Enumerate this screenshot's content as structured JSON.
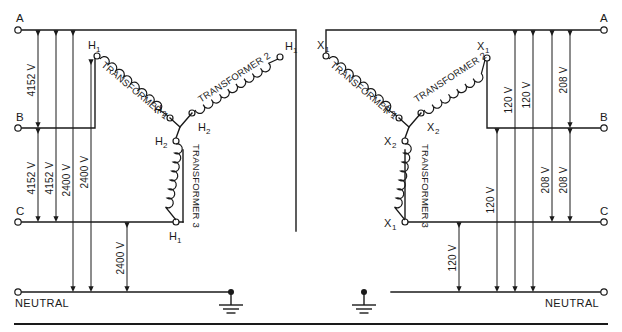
{
  "diagram": {
    "divider_label": "horizontal-rule",
    "ground_symbol": "earth-ground-icon"
  },
  "left": {
    "caption": "Primary wye (4152 V line-to-line, 2400 V line-to-neutral)",
    "neutral_label": "NEUTRAL",
    "bus_terminals": [
      {
        "name": "A",
        "label": "A"
      },
      {
        "name": "B",
        "label": "B"
      },
      {
        "name": "C",
        "label": "C"
      }
    ],
    "transformers": [
      {
        "id": "t1",
        "label": "TRANSFORMER 1",
        "term_start": "H",
        "term_start_sub": "1",
        "term_end": "H",
        "term_end_sub": "2"
      },
      {
        "id": "t2",
        "label": "TRANSFORMER 2",
        "term_start": "H",
        "term_start_sub": "1",
        "term_end": "H",
        "term_end_sub": "2"
      },
      {
        "id": "t3",
        "label": "TRANSFORMER 3",
        "term_start": "H",
        "term_start_sub": "2",
        "term_end": "H",
        "term_end_sub": "1"
      }
    ],
    "dimensions": [
      {
        "id": "l-ab",
        "value": "4152 V",
        "from": "A",
        "to": "B"
      },
      {
        "id": "l-bc",
        "value": "4152 V",
        "from": "B",
        "to": "C"
      },
      {
        "id": "l-ac",
        "value": "4152 V",
        "from": "A",
        "to": "C"
      },
      {
        "id": "l-an",
        "value": "2400 V",
        "from": "A",
        "to": "NEUTRAL"
      },
      {
        "id": "l-bn",
        "value": "2400 V",
        "from": "B",
        "to": "NEUTRAL"
      },
      {
        "id": "l-cn",
        "value": "2400 V",
        "from": "C",
        "to": "NEUTRAL"
      }
    ]
  },
  "right": {
    "caption": "Secondary wye (208 V line-to-line, 120 V line-to-neutral)",
    "neutral_label": "NEUTRAL",
    "bus_terminals": [
      {
        "name": "A",
        "label": "A"
      },
      {
        "name": "B",
        "label": "B"
      },
      {
        "name": "C",
        "label": "C"
      }
    ],
    "transformers": [
      {
        "id": "t1",
        "label": "TRANSFORMER 1",
        "term_start": "X",
        "term_start_sub": "1",
        "term_end": "X",
        "term_end_sub": "2"
      },
      {
        "id": "t2",
        "label": "TRANSFORMER 2",
        "term_start": "X",
        "term_start_sub": "1",
        "term_end": "X",
        "term_end_sub": "2"
      },
      {
        "id": "t3",
        "label": "TRANSFORMER 3",
        "term_start": "X",
        "term_start_sub": "2",
        "term_end": "X",
        "term_end_sub": "1"
      }
    ],
    "dimensions": [
      {
        "id": "r-bn",
        "value": "120 V",
        "from": "B",
        "to": "NEUTRAL"
      },
      {
        "id": "r-cn",
        "value": "120 V",
        "from": "C",
        "to": "NEUTRAL"
      },
      {
        "id": "r-an1",
        "value": "120 V",
        "from": "A",
        "to": "NEUTRAL"
      },
      {
        "id": "r-an2",
        "value": "120 V",
        "from": "A",
        "to": "NEUTRAL"
      },
      {
        "id": "r-ac",
        "value": "208 V",
        "from": "A",
        "to": "C"
      },
      {
        "id": "r-bc",
        "value": "208 V",
        "from": "B",
        "to": "C"
      },
      {
        "id": "r-ab",
        "value": "208 V",
        "from": "A",
        "to": "B"
      }
    ]
  }
}
